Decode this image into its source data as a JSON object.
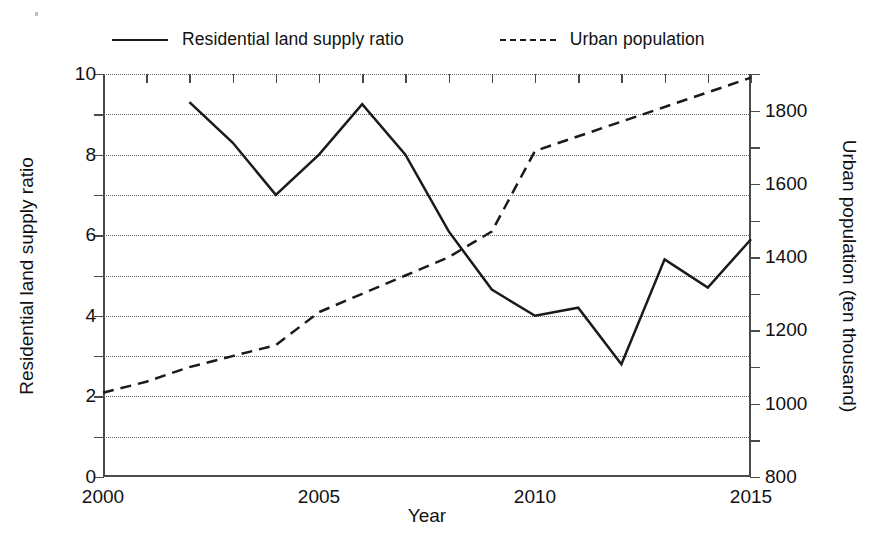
{
  "chart_data": {
    "type": "line",
    "title": "",
    "xlabel": "Year",
    "ylabel": "Residential land supply ratio",
    "y2label": "Urban population (ten thousand)",
    "x": [
      2000,
      2001,
      2002,
      2003,
      2004,
      2005,
      2006,
      2007,
      2008,
      2009,
      2010,
      2011,
      2012,
      2013,
      2014,
      2015
    ],
    "xlim": [
      2000,
      2015
    ],
    "ylim": [
      0,
      10
    ],
    "y2lim": [
      800,
      1900
    ],
    "grid": true,
    "legend_position": "top",
    "xticks": [
      2000,
      2005,
      2010,
      2015
    ],
    "xtick_labels": [
      "2000",
      "2005",
      "2010",
      "2015"
    ],
    "xtick_minor_step": 1,
    "yticks": [
      0,
      2,
      4,
      6,
      8,
      10
    ],
    "ytick_labels": [
      "0",
      "2",
      "4",
      "6",
      "8",
      "10"
    ],
    "ytick_minor": [
      1,
      3,
      5,
      7,
      9
    ],
    "y2ticks": [
      800,
      1000,
      1200,
      1400,
      1600,
      1800
    ],
    "y2tick_labels": [
      "800",
      "1000",
      "1200",
      "1400",
      "1600",
      "1800"
    ],
    "y2tick_minor": [
      900,
      1100,
      1300,
      1500,
      1700,
      1900
    ],
    "series": [
      {
        "name": "Residential land supply ratio",
        "style": "solid",
        "axis": "left",
        "x": [
          2002,
          2003,
          2004,
          2005,
          2006,
          2007,
          2008,
          2009,
          2010,
          2011,
          2012,
          2013,
          2014,
          2015
        ],
        "values": [
          9.3,
          8.3,
          7.0,
          8.0,
          9.25,
          8.0,
          6.1,
          4.65,
          4.0,
          4.2,
          2.8,
          5.4,
          4.7,
          5.9
        ]
      },
      {
        "name": "Urban population",
        "style": "dashed",
        "axis": "right",
        "x": [
          2000,
          2001,
          2002,
          2003,
          2004,
          2005,
          2006,
          2007,
          2008,
          2009,
          2010,
          2011,
          2012,
          2013,
          2014,
          2015
        ],
        "values": [
          1030,
          1060,
          1100,
          1130,
          1160,
          1250,
          1300,
          1350,
          1400,
          1470,
          1690,
          1730,
          1770,
          1810,
          1850,
          1890
        ]
      }
    ]
  },
  "legend": {
    "entries": [
      {
        "label": "Residential land supply ratio",
        "style": "solid"
      },
      {
        "label": "Urban population",
        "style": "dashed"
      }
    ]
  },
  "axes": {
    "x_title": "Year",
    "left_title": "Residential land supply ratio",
    "right_title": "Urban population (ten thousand)"
  },
  "colors": {
    "ink": "#1a1a1a",
    "axis": "#4a4a4a",
    "grid": "#656565",
    "background": "#ffffff"
  }
}
